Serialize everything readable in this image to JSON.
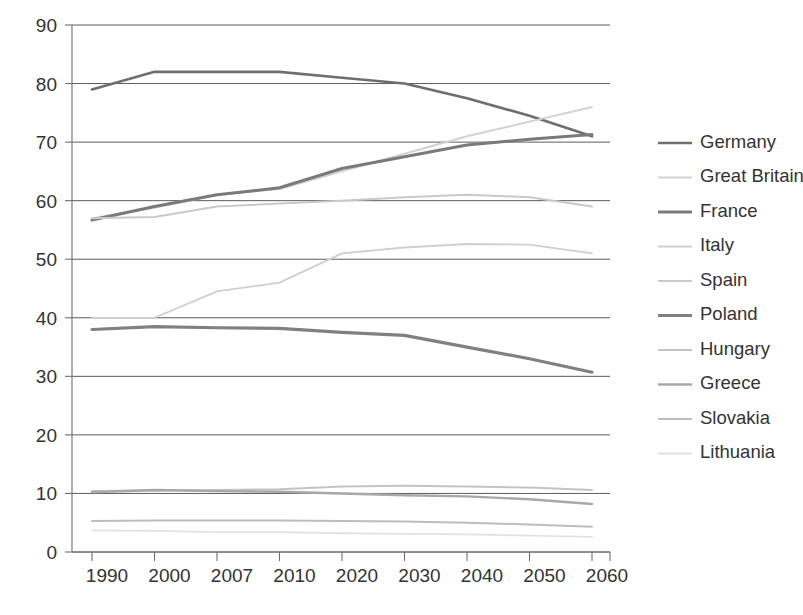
{
  "chart_data": {
    "type": "line",
    "title": "",
    "subtitle": "",
    "xlabel": "",
    "ylabel": "",
    "x": [
      "1990",
      "2000",
      "2007",
      "2010",
      "2020",
      "2030",
      "2040",
      "2050",
      "2060"
    ],
    "xtick_labels": [
      "1990",
      "2000",
      "2007",
      "2010",
      "2020",
      "2030",
      "2040",
      "2050",
      "2060"
    ],
    "ytick_labels": [
      "0",
      "10",
      "20",
      "30",
      "40",
      "50",
      "60",
      "70",
      "80",
      "90"
    ],
    "ylim": [
      0,
      90
    ],
    "ystep": 10,
    "grid": "horizontal",
    "legend_position": "right",
    "series": [
      {
        "name": "Germany",
        "color": "#6e6e6e",
        "width": 2.6,
        "values": [
          79.0,
          82.0,
          82.0,
          82.0,
          81.0,
          80.0,
          77.5,
          74.5,
          71.0
        ]
      },
      {
        "name": "Great Britain",
        "color": "#d2d2d2",
        "width": 2.0,
        "values": [
          57.0,
          58.8,
          61.0,
          62.0,
          65.0,
          68.0,
          71.0,
          73.5,
          76.0
        ]
      },
      {
        "name": "France",
        "color": "#7a7a7a",
        "width": 3.0,
        "values": [
          56.7,
          59.0,
          61.0,
          62.2,
          65.5,
          67.5,
          69.5,
          70.5,
          71.3
        ]
      },
      {
        "name": "Italy",
        "color": "#cfcfcf",
        "width": 1.8,
        "values": [
          40.0,
          40.0,
          44.5,
          46.0,
          51.0,
          52.0,
          52.6,
          52.5,
          51.0
        ]
      },
      {
        "name": "Spain",
        "color": "#c9c9c9",
        "width": 2.0,
        "values": [
          57.0,
          57.2,
          59.0,
          59.5,
          60.0,
          60.6,
          61.0,
          60.6,
          59.0
        ]
      },
      {
        "name": "Poland",
        "color": "#808080",
        "width": 3.2,
        "values": [
          38.0,
          38.5,
          38.3,
          38.2,
          37.5,
          37.0,
          35.0,
          33.0,
          30.7
        ]
      },
      {
        "name": "Hungary",
        "color": "#c4c4c4",
        "width": 2.0,
        "values": [
          10.4,
          10.5,
          10.6,
          10.7,
          11.2,
          11.3,
          11.2,
          11.0,
          10.6
        ]
      },
      {
        "name": "Greece",
        "color": "#a8a8a8",
        "width": 2.4,
        "values": [
          10.2,
          10.6,
          10.4,
          10.3,
          10.0,
          9.7,
          9.5,
          9.0,
          8.2
        ]
      },
      {
        "name": "Slovakia",
        "color": "#bdbdbd",
        "width": 2.0,
        "values": [
          5.3,
          5.4,
          5.4,
          5.4,
          5.3,
          5.2,
          5.0,
          4.7,
          4.3
        ]
      },
      {
        "name": "Lithuania",
        "color": "#e2e2e2",
        "width": 1.8,
        "values": [
          3.7,
          3.6,
          3.4,
          3.4,
          3.2,
          3.1,
          3.0,
          2.8,
          2.6
        ]
      }
    ]
  },
  "legend": {
    "items": [
      {
        "label": "Germany"
      },
      {
        "label": "Great Britain"
      },
      {
        "label": "France"
      },
      {
        "label": "Italy"
      },
      {
        "label": "Spain"
      },
      {
        "label": "Poland"
      },
      {
        "label": "Hungary"
      },
      {
        "label": "Greece"
      },
      {
        "label": "Slovakia"
      },
      {
        "label": "Lithuania"
      }
    ]
  }
}
